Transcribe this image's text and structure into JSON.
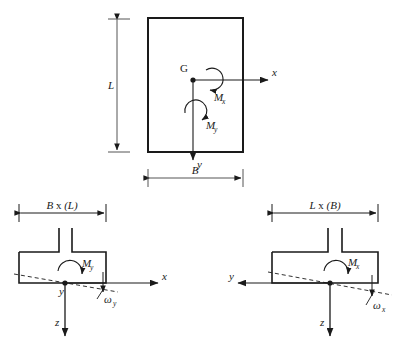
{
  "figure": {
    "ink_color": "#1a1a1a",
    "background": "#ffffff"
  },
  "plan_view": {
    "name": "rectangular-plan",
    "centroid_label": "G",
    "dim_height_label": "L",
    "dim_width_label": "B",
    "axis_x_label": "x",
    "axis_y_label": "y",
    "moment_x_label": "M",
    "moment_x_sub": "x",
    "moment_y_label": "M",
    "moment_y_sub": "y",
    "rect": {
      "x": 148,
      "y": 18,
      "w": 95,
      "h": 134
    }
  },
  "section_left": {
    "name": "section-view-y",
    "dim_label_main": "B",
    "dim_label_mid": " x ",
    "dim_label_paren": "(L)",
    "moment_label": "M",
    "moment_sub": "y",
    "axis_x_label": "x",
    "axis_y_label": "y",
    "axis_z_label": "z",
    "rotation_label": "ω",
    "rotation_sub": "y"
  },
  "section_right": {
    "name": "section-view-x",
    "dim_label_main": "L",
    "dim_label_mid": " x ",
    "dim_label_paren": "(B)",
    "moment_label": "M",
    "moment_sub": "x",
    "axis_y_label": "y",
    "axis_z_label": "z",
    "rotation_label": "ω",
    "rotation_sub": "x"
  }
}
